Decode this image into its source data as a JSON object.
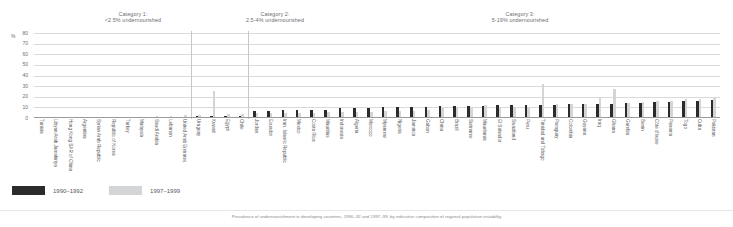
{
  "axis": {
    "unit_label": "%",
    "ticks": [
      80,
      70,
      60,
      50,
      40,
      30,
      20,
      10,
      0
    ],
    "ylim": [
      0,
      80
    ]
  },
  "categories_headers": [
    {
      "line1": "Category 1:",
      "line2": "<2.5% undernourished"
    },
    {
      "line1": "Category 2:",
      "line2": "2.5-4% undernourished"
    },
    {
      "line1": "Category 3:",
      "line2": "5-19% undernourished"
    }
  ],
  "legend": [
    {
      "label": "1990–1992",
      "color": "#2b2b2b"
    },
    {
      "label": "1997–1999",
      "color": "#d4d5d6"
    }
  ],
  "footnote": "Prevalence of undernourishment in developing countries, 1990–92 and 1997–99, by indicative composition of regional population instability",
  "chart_data": {
    "type": "bar",
    "title": "",
    "xlabel": "",
    "ylabel": "%",
    "ylim": [
      0,
      80
    ],
    "grid": true,
    "legend_position": "bottom-left",
    "categories": [
      "Tunisia",
      "Libyan Arab Jamahiriya",
      "Hong Kong SAR of China",
      "Argentina",
      "Syrian Arab Republic",
      "Republic of Korea",
      "Turkey",
      "Malaysia",
      "Saudi Arabia",
      "Lebanon",
      "United Arab Emirates",
      "Uruguay",
      "Kuwait",
      "Egypt",
      "Chile",
      "Jordan",
      "Ecuador",
      "Iran, Islamic Republic",
      "Mexico",
      "Costa Rica",
      "Mauritius",
      "Indonesia",
      "Algeria",
      "Morocco",
      "Myanmar",
      "Nigeria",
      "Jamaica",
      "Gabon",
      "China",
      "Brazil",
      "Suriname",
      "Mauritania",
      "El Salvador",
      "Swaziland",
      "Peru",
      "Trinidad and Tobago",
      "Paraguay",
      "Colombia",
      "Guyana",
      "Iraq",
      "Ghana",
      "Gambia",
      "Benin",
      "Côte d'Ivoire",
      "Panama",
      "Togo",
      "Cuba",
      "Pakistan"
    ],
    "group_spans": [
      {
        "name": "Category 1",
        "start": 0,
        "end": 10
      },
      {
        "name": "Category 2",
        "start": 11,
        "end": 14
      },
      {
        "name": "Category 3",
        "start": 15,
        "end": 47
      }
    ],
    "series": [
      {
        "name": "1990–1992",
        "color": "#2b2b2b",
        "values": [
          0,
          0,
          0,
          0,
          0,
          0,
          0,
          0,
          0,
          0,
          0,
          2,
          2,
          2,
          2,
          7,
          7,
          8,
          8,
          8,
          8,
          9,
          9,
          9,
          10,
          10,
          10,
          10,
          11,
          11,
          11,
          11,
          12,
          12,
          12,
          12,
          12,
          13,
          13,
          13,
          13,
          14,
          14,
          15,
          15,
          16,
          16,
          17
        ]
      },
      {
        "name": "1997–1999",
        "color": "#d4d5d6",
        "values": [
          0,
          0,
          0,
          0,
          0,
          0,
          0,
          0,
          2,
          2,
          3,
          3,
          25,
          4,
          4,
          5,
          5,
          5,
          5,
          5,
          6,
          6,
          6,
          6,
          7,
          7,
          7,
          8,
          9,
          9,
          9,
          12,
          10,
          10,
          10,
          32,
          13,
          13,
          13,
          20,
          27,
          14,
          15,
          16,
          16,
          18,
          18,
          19
        ]
      }
    ]
  }
}
